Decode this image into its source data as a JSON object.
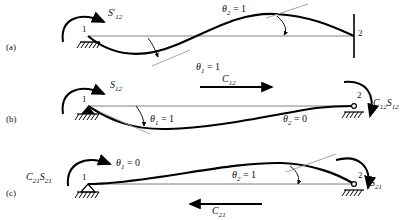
{
  "figure": {
    "beam": {
      "node1_label": "1",
      "node2_label": "2"
    },
    "colors": {
      "curve": "#000000",
      "axis": "#777777",
      "ink": "#111111",
      "background": "#ffffff"
    }
  },
  "panels": [
    {
      "id": "a",
      "label": "(a)",
      "node1": "1",
      "node2": "2",
      "moment_left": "S′₁₂",
      "moment_left_base": "S",
      "moment_left_prime": "′",
      "moment_left_sub": "12",
      "theta1": "θ₁ = 1",
      "theta1_sym": "θ",
      "theta1_sub": "1",
      "theta1_val": "= 1",
      "theta2": "θ₂ = 1",
      "theta2_sym": "θ",
      "theta2_sub": "2",
      "theta2_val": "= 1",
      "support_left": "fixed-hatched-support",
      "support_right": "vertical-end-line",
      "curve_shape": "antisymmetric-s-curve"
    },
    {
      "id": "b",
      "label": "(b)",
      "node1": "1",
      "node2": "2",
      "moment_left_base": "S",
      "moment_left_sub": "12",
      "moment_right_base": "C",
      "moment_right_sub1": "12",
      "moment_right_base2": "S",
      "moment_right_sub2": "12",
      "carryover_base": "C",
      "carryover_sub": "12",
      "carryover_direction": "right",
      "theta1_sym": "θ",
      "theta1_sub": "1",
      "theta1_val": "= 1",
      "theta2_sym": "θ",
      "theta2_sub": "2",
      "theta2_val": "= 0",
      "support_left": "pin-hatched-support",
      "support_right": "roller-hatched-support",
      "curve_shape": "downward-single-hump"
    },
    {
      "id": "c",
      "label": "(c)",
      "node1": "1",
      "node2": "2",
      "moment_left_base": "C",
      "moment_left_sub1": "21",
      "moment_left_base2": "S",
      "moment_left_sub2": "21",
      "moment_right_base": "S",
      "moment_right_sub": "21",
      "carryover_base": "C",
      "carryover_sub": "21",
      "carryover_direction": "left",
      "theta1_sym": "θ",
      "theta1_sub": "1",
      "theta1_val": "= 0",
      "theta2_sym": "θ",
      "theta2_sub": "2",
      "theta2_val": "= 1",
      "support_left": "pin-hatched-support",
      "support_right": "roller-hatched-support",
      "curve_shape": "upward-single-hump"
    }
  ]
}
